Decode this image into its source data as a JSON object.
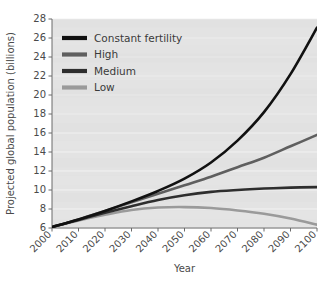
{
  "chart_data": {
    "type": "line",
    "title": "",
    "xlabel": "Year",
    "ylabel": "Projected global population (billions)",
    "xlim": [
      2000,
      2100
    ],
    "ylim": [
      6,
      28
    ],
    "ytick_step": 2,
    "xtick_step": 10,
    "grid": "horizontal",
    "legend_position": "top-left",
    "xticks": [
      "2000",
      "2010",
      "2020",
      "2030",
      "2040",
      "2050",
      "2060",
      "2070",
      "2080",
      "2090",
      "2100"
    ],
    "yticks": [
      "6",
      "8",
      "10",
      "12",
      "14",
      "16",
      "18",
      "20",
      "22",
      "24",
      "26",
      "28"
    ],
    "x": [
      2000,
      2010,
      2020,
      2030,
      2040,
      2050,
      2060,
      2070,
      2080,
      2090,
      2100
    ],
    "series": [
      {
        "name": "Constant fertility",
        "color": "#111111",
        "width": 2.6,
        "values": [
          6.1,
          6.9,
          7.8,
          8.8,
          9.9,
          11.2,
          12.9,
          15.2,
          18.2,
          22.2,
          27.1
        ]
      },
      {
        "name": "High",
        "color": "#5f5f5f",
        "width": 2.6,
        "values": [
          6.1,
          6.9,
          7.8,
          8.7,
          9.6,
          10.5,
          11.4,
          12.4,
          13.4,
          14.6,
          15.8
        ]
      },
      {
        "name": "Medium",
        "color": "#2e2e2e",
        "width": 2.6,
        "values": [
          6.1,
          6.85,
          7.6,
          8.3,
          8.95,
          9.45,
          9.8,
          10.0,
          10.15,
          10.25,
          10.3
        ]
      },
      {
        "name": "Low",
        "color": "#9a9a9a",
        "width": 2.6,
        "values": [
          6.1,
          6.8,
          7.4,
          7.9,
          8.15,
          8.2,
          8.1,
          7.85,
          7.5,
          7.0,
          6.35
        ]
      }
    ]
  },
  "legend": {
    "items": [
      {
        "label": "Constant fertility",
        "color": "#111111"
      },
      {
        "label": "High",
        "color": "#5f5f5f"
      },
      {
        "label": "Medium",
        "color": "#2e2e2e"
      },
      {
        "label": "Low",
        "color": "#9a9a9a"
      }
    ]
  },
  "caption": {
    "text": ""
  }
}
